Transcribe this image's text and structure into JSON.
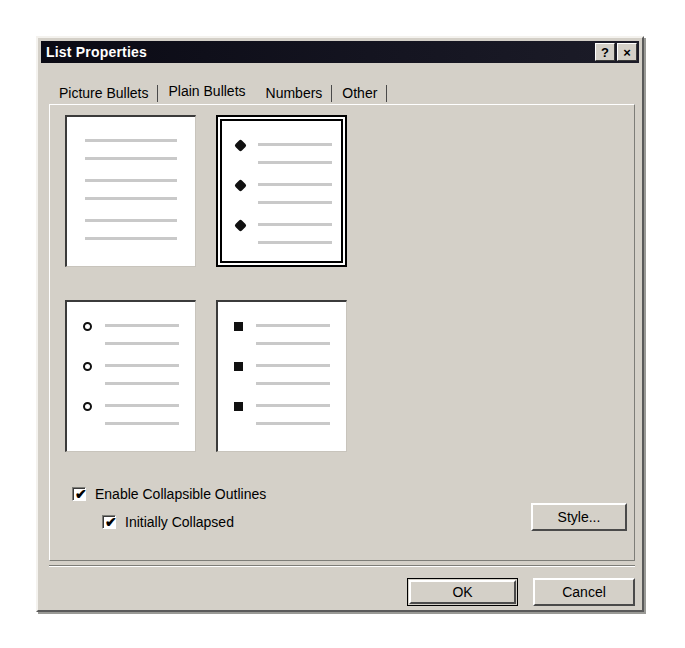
{
  "window": {
    "title": "List Properties",
    "help_button": "?",
    "close_button": "×"
  },
  "tabs": [
    {
      "label": "Picture Bullets",
      "selected": false
    },
    {
      "label": "Plain Bullets",
      "selected": true
    },
    {
      "label": "Numbers",
      "selected": false
    },
    {
      "label": "Other",
      "selected": false
    }
  ],
  "bullet_previews": [
    {
      "name": "no-bullets",
      "bullet": "none",
      "selected": false,
      "lines": 6
    },
    {
      "name": "diamond-bullets",
      "bullet": "diamond",
      "selected": true,
      "lines": 6
    },
    {
      "name": "hollow-circle-bullets",
      "bullet": "circle",
      "selected": false,
      "lines": 6
    },
    {
      "name": "filled-square-bullets",
      "bullet": "square",
      "selected": false,
      "lines": 6
    }
  ],
  "options": {
    "enable_collapsible_outlines": {
      "label": "Enable Collapsible Outlines",
      "checked": true,
      "mark": "✔"
    },
    "initially_collapsed": {
      "label": "Initially Collapsed",
      "checked": true,
      "mark": "✔"
    }
  },
  "buttons": {
    "style": "Style...",
    "ok": "OK",
    "cancel": "Cancel"
  },
  "colors": {
    "dialog_face": "#d4d0c8",
    "titlebar": "#121220",
    "title_text": "#ffffff",
    "preview_bg": "#ffffff",
    "preview_line": "#c9c9c9",
    "bullet": "#111111",
    "selection_border": "#000000"
  }
}
